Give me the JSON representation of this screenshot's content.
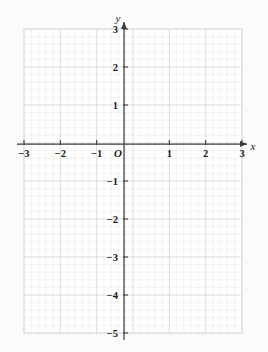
{
  "chart_data": {
    "type": "scatter",
    "title": "",
    "subtitle": "",
    "xlabel": "x",
    "ylabel": "y",
    "xlim": [
      -3,
      3
    ],
    "ylim": [
      -5,
      3
    ],
    "grid": true,
    "minor_grid": true,
    "minor_divisions_per_unit": 5,
    "legend": "none",
    "series": [],
    "x_tick_labels": [
      "−3",
      "−2",
      "−1",
      "1",
      "2",
      "3"
    ],
    "x_tick_values": [
      -3,
      -2,
      -1,
      1,
      2,
      3
    ],
    "y_tick_labels": [
      "3",
      "2",
      "1",
      "−1",
      "−2",
      "−3",
      "−4",
      "−5"
    ],
    "y_tick_values": [
      3,
      2,
      1,
      -1,
      -2,
      -3,
      -4,
      -5
    ],
    "origin_label": "O",
    "annotations": [],
    "colors": {
      "background": "#fbfbfb",
      "plot_background": "#ffffff",
      "minor_gridline": "#ebebeb",
      "major_gridline": "#d9d9d9",
      "axis": "#3c3c3c",
      "text": "#1a1a1a"
    }
  },
  "axes": {
    "x_axis_name": "x",
    "y_axis_name": "y",
    "origin": "O"
  },
  "ticks": {
    "x": [
      {
        "value": -3,
        "label": "−3"
      },
      {
        "value": -2,
        "label": "−2"
      },
      {
        "value": -1,
        "label": "−1"
      },
      {
        "value": 1,
        "label": "1"
      },
      {
        "value": 2,
        "label": "2"
      },
      {
        "value": 3,
        "label": "3"
      }
    ],
    "y": [
      {
        "value": 3,
        "label": "3"
      },
      {
        "value": 2,
        "label": "2"
      },
      {
        "value": 1,
        "label": "1"
      },
      {
        "value": -1,
        "label": "−1"
      },
      {
        "value": -2,
        "label": "−2"
      },
      {
        "value": -3,
        "label": "−3"
      },
      {
        "value": -4,
        "label": "−4"
      },
      {
        "value": -5,
        "label": "−5"
      }
    ]
  }
}
